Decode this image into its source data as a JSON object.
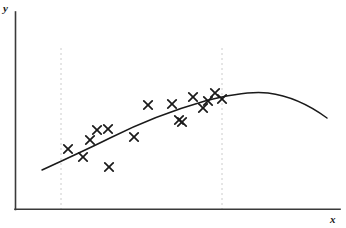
{
  "figure": {
    "width": 346,
    "height": 228,
    "background": "#ffffff"
  },
  "axes": {
    "y_label": "y",
    "x_label": "x",
    "axis_color": "#3a3a3a",
    "y_axis": {
      "x": 15,
      "y_top": 12,
      "y_bottom": 209
    },
    "x_axis": {
      "y": 209,
      "x_left": 15,
      "x_right": 340
    }
  },
  "guides": {
    "color": "#cccccc",
    "dash": "2,3",
    "lines": [
      {
        "name": "left-boundary",
        "x": 61,
        "y_top": 48,
        "y_bottom": 209
      },
      {
        "name": "right-boundary",
        "x": 222,
        "y_top": 48,
        "y_bottom": 209
      }
    ]
  },
  "chart_data": {
    "type": "scatter",
    "title": "",
    "subtitle": "",
    "xlabel": "x",
    "ylabel": "y",
    "xlim": [
      15,
      340
    ],
    "ylim": [
      12,
      209
    ],
    "grid": false,
    "legend": null,
    "annotations": [],
    "series": [
      {
        "name": "observations",
        "type": "scatter",
        "marker": "x",
        "color": "#1a1a1a",
        "points": [
          {
            "x": 68,
            "y": 149
          },
          {
            "x": 83,
            "y": 157
          },
          {
            "x": 90,
            "y": 140
          },
          {
            "x": 97,
            "y": 130
          },
          {
            "x": 108,
            "y": 129
          },
          {
            "x": 109,
            "y": 167
          },
          {
            "x": 134,
            "y": 137
          },
          {
            "x": 148,
            "y": 105
          },
          {
            "x": 172,
            "y": 104
          },
          {
            "x": 179,
            "y": 120
          },
          {
            "x": 182,
            "y": 122
          },
          {
            "x": 193,
            "y": 97
          },
          {
            "x": 203,
            "y": 108
          },
          {
            "x": 208,
            "y": 101
          },
          {
            "x": 215,
            "y": 93
          },
          {
            "x": 222,
            "y": 99
          }
        ]
      },
      {
        "name": "fitted-curve",
        "type": "line",
        "color": "#1a1a1a",
        "path": "M 42,170 C 70,157 88,149 110,138 C 140,123 170,111 205,101 C 232,94 252,91 268,93 C 292,96 312,107 327,118"
      }
    ]
  }
}
